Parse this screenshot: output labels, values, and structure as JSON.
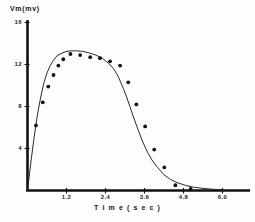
{
  "chart_data": {
    "type": "scatter",
    "title": "",
    "xlabel": "T i m e  ( s e c )",
    "ylabel": "Vm(mv)",
    "xlim": [
      0,
      6.0
    ],
    "ylim": [
      0,
      16
    ],
    "grid": false,
    "legend": null,
    "xticks": [
      1.2,
      2.4,
      3.6,
      4.8,
      6.0
    ],
    "xtick_labels": [
      "1.2",
      "2.4",
      "3.6",
      "4.8",
      "6.0"
    ],
    "yticks": [
      4,
      8,
      12,
      16
    ],
    "ytick_labels": [
      "4",
      "8",
      "12",
      "16"
    ],
    "series": [
      {
        "name": "measured",
        "type": "scatter",
        "marker": "filled-circle",
        "color": "#111111",
        "x": [
          0.26,
          0.47,
          0.64,
          0.8,
          0.95,
          1.1,
          1.32,
          1.62,
          1.93,
          2.23,
          2.54,
          2.85,
          3.1,
          3.35,
          3.62,
          3.9,
          4.21,
          4.55,
          5.02
        ],
        "y": [
          6.2,
          8.4,
          9.9,
          11.0,
          11.9,
          12.5,
          13.0,
          12.9,
          12.7,
          12.6,
          12.3,
          11.9,
          10.3,
          8.2,
          6.1,
          3.9,
          2.2,
          0.5,
          0.15
        ]
      },
      {
        "name": "fitted curve",
        "type": "line",
        "color": "#262626",
        "x": [
          0.0,
          0.1,
          0.2,
          0.3,
          0.4,
          0.5,
          0.6,
          0.7,
          0.8,
          0.9,
          1.0,
          1.15,
          1.3,
          1.5,
          1.7,
          1.9,
          2.1,
          2.3,
          2.5,
          2.65,
          2.8,
          2.95,
          3.05,
          3.15,
          3.25,
          3.4,
          3.55,
          3.7,
          3.85,
          4.0,
          4.2,
          4.4,
          4.6,
          4.85,
          5.1,
          5.4,
          5.7,
          6.0
        ],
        "y": [
          0.0,
          2.6,
          5.0,
          7.1,
          8.8,
          10.2,
          11.2,
          11.9,
          12.4,
          12.8,
          13.0,
          13.2,
          13.3,
          13.3,
          13.25,
          13.1,
          12.9,
          12.6,
          12.1,
          11.6,
          10.8,
          9.7,
          8.9,
          8.0,
          7.1,
          5.8,
          4.6,
          3.6,
          2.8,
          2.2,
          1.5,
          1.05,
          0.75,
          0.5,
          0.32,
          0.2,
          0.12,
          0.08
        ]
      }
    ]
  },
  "axes": {
    "y_axis_name": "vertical-axis",
    "x_axis_name": "horizontal-axis"
  }
}
